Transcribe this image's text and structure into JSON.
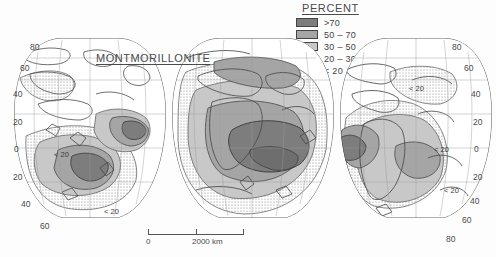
{
  "map": {
    "title": "MONTMORILLONITE",
    "projection": "interrupted-goode-homolosine",
    "lobes": 3
  },
  "legend": {
    "title": "PERCENT",
    "entries": [
      {
        "label": ">70",
        "swatch": "dark-gray",
        "color": "#7d7d7d"
      },
      {
        "label": "50 – 70",
        "swatch": "medium-gray",
        "color": "#a5a5a5"
      },
      {
        "label": "30 – 50",
        "swatch": "light-gray",
        "color": "#c8c8c8"
      },
      {
        "label": "20 – 30",
        "swatch": "stipple",
        "color": "#ffffff"
      },
      {
        "label": "< 20",
        "swatch": "white",
        "color": "#ffffff"
      }
    ]
  },
  "latitude_labels": {
    "left": [
      "80",
      "60",
      "40",
      "20",
      "0",
      "20",
      "40",
      "60"
    ],
    "right": [
      "80",
      "60",
      "40",
      "20",
      "0",
      "20",
      "40",
      "60",
      "80"
    ]
  },
  "annotations": [
    {
      "text": "< 20",
      "region": "north-atlantic"
    },
    {
      "text": "< 20",
      "region": "south-atlantic"
    },
    {
      "text": "< 20",
      "region": "south-america"
    },
    {
      "text": "< 20",
      "region": "south-pacific"
    },
    {
      "text": "< 20",
      "region": "southern-ocean-left"
    }
  ],
  "scalebar": {
    "zero_label": "0",
    "max_label": "2000 km",
    "ticks": 3
  },
  "colors": {
    "background": "#fdfdfd",
    "coastline": "#4a4a4a",
    "graticule": "#8d8d8d",
    "text": "#4a4a4a"
  }
}
